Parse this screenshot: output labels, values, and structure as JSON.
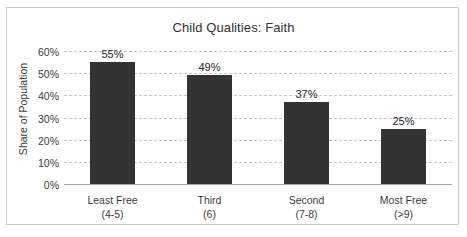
{
  "chart_data": {
    "type": "bar",
    "title": "Child Qualities: Faith",
    "xlabel": "",
    "ylabel": "Share of Population",
    "categories": [
      "Least Free",
      "Third",
      "Second",
      "Most Free"
    ],
    "category_sublabels": [
      "(4-5)",
      "(6)",
      "(7-8)",
      "(>9)"
    ],
    "values": [
      55,
      49,
      37,
      25
    ],
    "value_labels": [
      "55%",
      "49%",
      "37%",
      "25%"
    ],
    "ylim": [
      0,
      60
    ],
    "ytick_values": [
      60,
      50,
      40,
      30,
      20,
      10,
      0
    ],
    "ytick_labels": [
      "60%",
      "50%",
      "40%",
      "30%",
      "20%",
      "10%",
      "0%"
    ],
    "grid": true,
    "gridline_style": "dashed",
    "legend": false,
    "legend_position": "none",
    "colors": {
      "bar": "#333333",
      "gridline": "#c5c5c5",
      "axis": "#a6a6a6",
      "text": "#3b3b3b",
      "title_text": "#2f2f2f",
      "frame_border": "#c9c9c9",
      "background": "#ffffff"
    }
  }
}
